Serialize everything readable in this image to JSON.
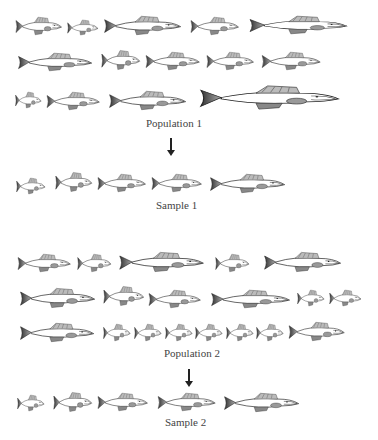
{
  "figure": {
    "population1": {
      "label": "Population 1",
      "fish": [
        {
          "x": 15,
          "y": 15,
          "w": 48,
          "h": 22
        },
        {
          "x": 67,
          "y": 18,
          "w": 32,
          "h": 19
        },
        {
          "x": 103,
          "y": 14,
          "w": 80,
          "h": 23
        },
        {
          "x": 190,
          "y": 15,
          "w": 50,
          "h": 22
        },
        {
          "x": 248,
          "y": 14,
          "w": 102,
          "h": 22
        },
        {
          "x": 17,
          "y": 51,
          "w": 77,
          "h": 22
        },
        {
          "x": 101,
          "y": 48,
          "w": 40,
          "h": 24
        },
        {
          "x": 145,
          "y": 50,
          "w": 56,
          "h": 22
        },
        {
          "x": 206,
          "y": 50,
          "w": 49,
          "h": 22
        },
        {
          "x": 261,
          "y": 50,
          "w": 61,
          "h": 22
        },
        {
          "x": 15,
          "y": 90,
          "w": 27,
          "h": 20
        },
        {
          "x": 46,
          "y": 90,
          "w": 55,
          "h": 22
        },
        {
          "x": 108,
          "y": 89,
          "w": 80,
          "h": 23
        },
        {
          "x": 198,
          "y": 83,
          "w": 145,
          "h": 29
        }
      ]
    },
    "arrow1": {
      "x": 170,
      "y": 140,
      "h": 12
    },
    "sample1": {
      "label": "Sample 1",
      "fish": [
        {
          "x": 16,
          "y": 176,
          "w": 30,
          "h": 20
        },
        {
          "x": 55,
          "y": 170,
          "w": 38,
          "h": 24
        },
        {
          "x": 97,
          "y": 172,
          "w": 50,
          "h": 22
        },
        {
          "x": 151,
          "y": 172,
          "w": 52,
          "h": 22
        },
        {
          "x": 209,
          "y": 172,
          "w": 78,
          "h": 23
        }
      ]
    },
    "population2": {
      "label": "Population 2",
      "fish": [
        {
          "x": 17,
          "y": 252,
          "w": 55,
          "h": 22
        },
        {
          "x": 77,
          "y": 252,
          "w": 35,
          "h": 22
        },
        {
          "x": 118,
          "y": 250,
          "w": 88,
          "h": 24
        },
        {
          "x": 215,
          "y": 252,
          "w": 35,
          "h": 22
        },
        {
          "x": 263,
          "y": 250,
          "w": 80,
          "h": 24
        }
      ],
      "fish_row2": [
        {
          "x": 19,
          "y": 286,
          "w": 78,
          "h": 24
        },
        {
          "x": 103,
          "y": 284,
          "w": 42,
          "h": 24
        },
        {
          "x": 148,
          "y": 288,
          "w": 54,
          "h": 22
        },
        {
          "x": 210,
          "y": 288,
          "w": 82,
          "h": 22
        },
        {
          "x": 297,
          "y": 288,
          "w": 28,
          "h": 20
        },
        {
          "x": 329,
          "y": 288,
          "w": 33,
          "h": 20
        }
      ],
      "fish_row3": [
        {
          "x": 19,
          "y": 321,
          "w": 77,
          "h": 23
        },
        {
          "x": 103,
          "y": 322,
          "w": 28,
          "h": 21
        },
        {
          "x": 134,
          "y": 322,
          "w": 28,
          "h": 21
        },
        {
          "x": 165,
          "y": 322,
          "w": 28,
          "h": 21
        },
        {
          "x": 195,
          "y": 322,
          "w": 28,
          "h": 21
        },
        {
          "x": 226,
          "y": 322,
          "w": 28,
          "h": 21
        },
        {
          "x": 256,
          "y": 322,
          "w": 28,
          "h": 21
        },
        {
          "x": 288,
          "y": 320,
          "w": 58,
          "h": 23
        }
      ]
    },
    "arrow2": {
      "x": 188,
      "y": 372,
      "h": 12
    },
    "sample2": {
      "label": "Sample 2",
      "fish": [
        {
          "x": 17,
          "y": 393,
          "w": 28,
          "h": 20
        },
        {
          "x": 53,
          "y": 390,
          "w": 40,
          "h": 24
        },
        {
          "x": 97,
          "y": 391,
          "w": 52,
          "h": 22
        },
        {
          "x": 157,
          "y": 391,
          "w": 60,
          "h": 22
        },
        {
          "x": 223,
          "y": 391,
          "w": 78,
          "h": 23
        }
      ]
    }
  }
}
